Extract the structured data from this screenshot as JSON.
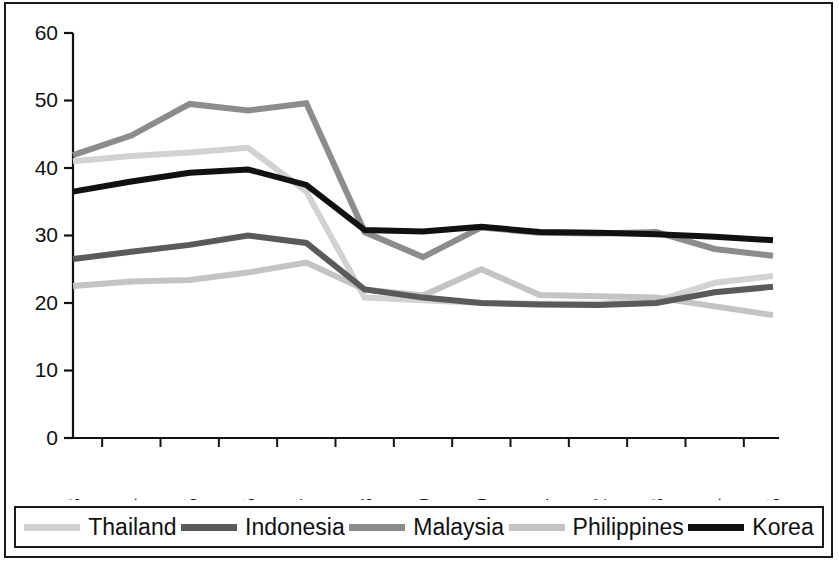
{
  "chart_data": {
    "type": "line",
    "title": "",
    "subtitle": "",
    "xlabel": "",
    "ylabel": "",
    "categories": [
      "1993",
      "1994",
      "1995",
      "1996",
      "1997",
      "1998",
      "1999",
      "2000",
      "2001",
      "2002",
      "2003",
      "2004",
      "2005"
    ],
    "x": [
      1993,
      1994,
      1995,
      1996,
      1997,
      1998,
      1999,
      2000,
      2001,
      2002,
      2003,
      2004,
      2005
    ],
    "ylim": [
      0,
      60
    ],
    "xlim": [
      1993,
      2005
    ],
    "yticks": [
      0,
      10,
      20,
      30,
      40,
      50,
      60
    ],
    "ytick_labels": [
      "0",
      "10",
      "20",
      "30",
      "40",
      "50",
      "60"
    ],
    "grid": false,
    "legend_position": "bottom",
    "series": [
      {
        "name": "Thailand",
        "color": "#d2d2d2",
        "values": [
          41.0,
          41.8,
          42.3,
          43.0,
          36.5,
          20.8,
          20.4,
          20.0,
          19.9,
          19.9,
          20.3,
          23.0,
          24.0
        ]
      },
      {
        "name": "Indonesia",
        "color": "#5a5a5a",
        "values": [
          26.5,
          27.6,
          28.6,
          30.0,
          28.9,
          22.0,
          20.8,
          20.0,
          19.8,
          19.7,
          20.0,
          21.6,
          22.4
        ]
      },
      {
        "name": "Malaysia",
        "color": "#8c8c8c",
        "values": [
          41.9,
          44.8,
          49.5,
          48.5,
          49.6,
          30.5,
          26.8,
          31.2,
          30.4,
          30.3,
          30.5,
          28.0,
          27.0
        ]
      },
      {
        "name": "Philippines",
        "color": "#c4c4c4",
        "values": [
          22.5,
          23.2,
          23.4,
          24.5,
          26.0,
          22.0,
          21.1,
          25.0,
          21.2,
          21.0,
          20.8,
          19.5,
          18.2
        ]
      },
      {
        "name": "Korea",
        "color": "#111111",
        "values": [
          36.5,
          38.0,
          39.3,
          39.8,
          37.5,
          30.8,
          30.6,
          31.3,
          30.5,
          30.4,
          30.2,
          29.8,
          29.3
        ]
      }
    ]
  },
  "legend": {
    "items": [
      {
        "label": "Thailand",
        "color": "#d2d2d2"
      },
      {
        "label": "Indonesia",
        "color": "#5a5a5a"
      },
      {
        "label": "Malaysia",
        "color": "#8c8c8c"
      },
      {
        "label": "Philippines",
        "color": "#c4c4c4"
      },
      {
        "label": "Korea",
        "color": "#111111"
      }
    ]
  }
}
